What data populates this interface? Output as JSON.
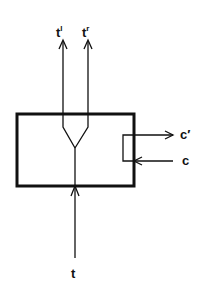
{
  "diagram": {
    "labels": {
      "output_left": "t",
      "output_left_sup": "l",
      "output_right": "t",
      "output_right_sup": "r",
      "input_bottom": "t",
      "ctrl_out": "c′",
      "ctrl_in": "c"
    },
    "colors": {
      "stroke": "#111111",
      "background": "#ffffff"
    }
  }
}
